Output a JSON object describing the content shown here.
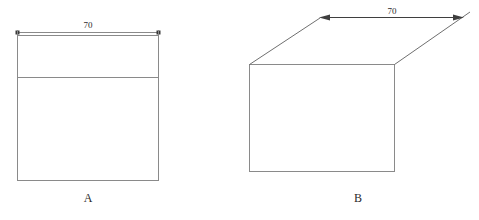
{
  "page": {
    "background_color": "#ffffff",
    "width": 479,
    "height": 220
  },
  "style": {
    "edge_color": "#8a8a8a",
    "slant_edge_color": "#6f6f6f",
    "dimension_color_a": "#8a8a8a",
    "dimension_color_b": "#3f3f3f",
    "text_color": "#2b2b2b",
    "face_color": "#ffffff"
  },
  "figures": [
    {
      "id": "figure-a",
      "label": "A",
      "type": "front-elevation",
      "label_position": {
        "x": 88,
        "y": 202
      },
      "rectangle": {
        "x": 17,
        "y": 35,
        "width": 142,
        "height": 146
      },
      "divider_line": {
        "x1": 17,
        "y1": 77,
        "x2": 159,
        "y2": 77
      },
      "dimension": {
        "value": "70",
        "label_position": {
          "x": 88,
          "y": 28
        },
        "line": {
          "x1": 17,
          "y1": 32,
          "x2": 159,
          "y2": 32
        },
        "endpoint_style": "square-tick"
      }
    },
    {
      "id": "figure-b",
      "label": "B",
      "type": "isometric-box",
      "label_position": {
        "x": 358,
        "y": 202
      },
      "front_face": {
        "x": 249,
        "y": 64,
        "width": 146,
        "height": 108
      },
      "top_edges": [
        {
          "x1": 249,
          "y1": 64,
          "x2": 320,
          "y2": 18
        },
        {
          "x1": 395,
          "y1": 64,
          "x2": 470,
          "y2": 12
        }
      ],
      "dimension": {
        "value": "70",
        "label_position": {
          "x": 392,
          "y": 14
        },
        "line": {
          "x1": 320,
          "y1": 18,
          "x2": 462,
          "y2": 18
        },
        "endpoint_style": "arrowhead"
      }
    }
  ]
}
